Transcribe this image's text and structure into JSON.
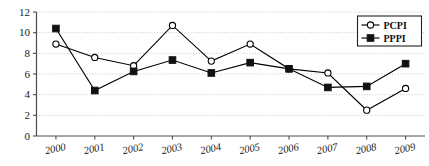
{
  "chart_data": {
    "type": "line",
    "title": "",
    "xlabel": "",
    "ylabel": "",
    "categories": [
      "2000",
      "2001",
      "2002",
      "2003",
      "2004",
      "2005",
      "2006",
      "2007",
      "2008",
      "2009"
    ],
    "series": [
      {
        "name": "PCPI",
        "marker": "open-circle",
        "color": "#000000",
        "values": [
          8.9,
          7.6,
          6.8,
          10.7,
          7.25,
          8.9,
          6.5,
          6.1,
          2.5,
          4.6
        ]
      },
      {
        "name": "PPPI",
        "marker": "filled-square",
        "color": "#111111",
        "values": [
          10.4,
          4.4,
          6.25,
          7.35,
          6.1,
          7.1,
          6.5,
          4.7,
          4.8,
          7.0
        ]
      }
    ],
    "ylim": [
      0,
      12
    ],
    "yticks": [
      "0",
      "2",
      "4",
      "6",
      "8",
      "10",
      "12"
    ],
    "ytick_values": [
      0,
      2,
      4,
      6,
      8,
      10,
      12
    ],
    "grid": true,
    "grid_axis": "y",
    "legend_position": "top-right",
    "legend_entries": [
      "PCPI",
      "PPPI"
    ]
  },
  "axes": {
    "y_axis_name": "value-axis",
    "x_axis_name": "year-axis"
  },
  "legend": {
    "items": [
      {
        "label": "PCPI",
        "marker": "open-circle"
      },
      {
        "label": "PPPI",
        "marker": "filled-square"
      }
    ]
  }
}
